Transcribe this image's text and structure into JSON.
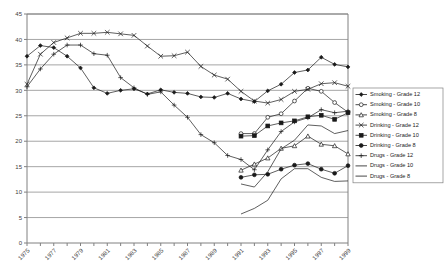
{
  "chart_data": {
    "type": "line",
    "title": "",
    "xlabel": "",
    "ylabel": "",
    "ylim": [
      0,
      45
    ],
    "ytick_step": 5,
    "yticks": [
      0,
      5,
      10,
      15,
      20,
      25,
      30,
      35,
      40,
      45
    ],
    "grid": true,
    "legend_position": "right",
    "x": [
      1975,
      1976,
      1977,
      1978,
      1979,
      1980,
      1981,
      1982,
      1983,
      1984,
      1985,
      1986,
      1987,
      1988,
      1989,
      1990,
      1991,
      1992,
      1993,
      1994,
      1995,
      1996,
      1997,
      1998,
      1999
    ],
    "xtick_labels": [
      "1975",
      "",
      "1977",
      "",
      "1979",
      "",
      "1981",
      "",
      "1983",
      "",
      "1985",
      "",
      "1987",
      "",
      "1989",
      "",
      "1991",
      "",
      "1993",
      "",
      "1995",
      "",
      "1997",
      "",
      "1999"
    ],
    "series": [
      {
        "name": "Smoking - Grade 12",
        "marker": "filled-diamond",
        "x": [
          1975,
          1976,
          1977,
          1978,
          1979,
          1980,
          1981,
          1982,
          1983,
          1984,
          1985,
          1986,
          1987,
          1988,
          1989,
          1990,
          1991,
          1992,
          1993,
          1994,
          1995,
          1996,
          1997,
          1998,
          1999
        ],
        "values": [
          36.7,
          38.8,
          38.4,
          36.7,
          34.4,
          30.5,
          29.4,
          30.0,
          30.3,
          29.3,
          30.1,
          29.6,
          29.4,
          28.7,
          28.6,
          29.4,
          28.3,
          27.8,
          29.9,
          31.2,
          33.5,
          34.0,
          36.5,
          35.1,
          34.6
        ]
      },
      {
        "name": "Smoking - Grade 10",
        "marker": "open-circle",
        "x": [
          1991,
          1992,
          1993,
          1994,
          1995,
          1996,
          1997,
          1998,
          1999
        ],
        "values": [
          21.5,
          21.5,
          24.7,
          25.4,
          27.9,
          30.4,
          29.8,
          27.6,
          25.7
        ]
      },
      {
        "name": "Smoking - Grade 8",
        "marker": "open-triangle",
        "x": [
          1991,
          1992,
          1993,
          1994,
          1995,
          1996,
          1997,
          1998,
          1999
        ],
        "values": [
          14.3,
          15.5,
          16.7,
          18.6,
          19.1,
          21.0,
          19.4,
          19.1,
          17.5
        ]
      },
      {
        "name": "Drinking - Grade 12",
        "marker": "filled-x",
        "x": [
          1975,
          1976,
          1977,
          1978,
          1979,
          1980,
          1981,
          1982,
          1983,
          1984,
          1985,
          1986,
          1987,
          1988,
          1989,
          1990,
          1991,
          1992,
          1993,
          1994,
          1995,
          1996,
          1997,
          1998,
          1999
        ],
        "values": [
          31.2,
          37.1,
          39.4,
          40.3,
          41.2,
          41.2,
          41.4,
          41.1,
          40.8,
          38.7,
          36.7,
          36.8,
          37.5,
          34.7,
          33.0,
          32.2,
          29.8,
          27.9,
          27.5,
          28.2,
          29.8,
          30.2,
          31.3,
          31.5,
          30.8
        ]
      },
      {
        "name": "Drinking - Grade 10",
        "marker": "filled-square",
        "x": [
          1991,
          1992,
          1993,
          1994,
          1995,
          1996,
          1997,
          1998,
          1999
        ],
        "values": [
          21.0,
          21.1,
          23.0,
          23.6,
          24.0,
          24.8,
          25.1,
          24.3,
          25.6
        ]
      },
      {
        "name": "Drinking - Grade 8",
        "marker": "filled-circle",
        "x": [
          1991,
          1992,
          1993,
          1994,
          1995,
          1996,
          1997,
          1998,
          1999
        ],
        "values": [
          12.9,
          13.4,
          13.5,
          14.5,
          15.3,
          15.6,
          14.5,
          13.7,
          15.2
        ]
      },
      {
        "name": "Drugs - Grade 12",
        "marker": "plus",
        "x": [
          1975,
          1976,
          1977,
          1978,
          1979,
          1980,
          1981,
          1982,
          1983,
          1984,
          1985,
          1986,
          1987,
          1988,
          1989,
          1990,
          1991,
          1992,
          1993,
          1994,
          1995,
          1996,
          1997,
          1998,
          1999
        ],
        "values": [
          30.7,
          34.2,
          37.1,
          38.9,
          38.9,
          37.2,
          36.9,
          32.5,
          30.5,
          29.2,
          29.7,
          27.1,
          24.7,
          21.3,
          19.7,
          17.2,
          16.4,
          14.4,
          18.3,
          21.9,
          23.8,
          24.6,
          26.2,
          25.6,
          25.9
        ]
      },
      {
        "name": "Drugs - Grade 10",
        "marker": "line-only",
        "x": [
          1991,
          1992,
          1993,
          1994,
          1995,
          1996,
          1997,
          1998,
          1999
        ],
        "values": [
          11.6,
          11.0,
          14.0,
          18.5,
          20.2,
          23.2,
          23.0,
          21.5,
          22.1
        ]
      },
      {
        "name": "Drugs - Grade 8",
        "marker": "line-only-thick",
        "x": [
          1991,
          1992,
          1993,
          1994,
          1995,
          1996,
          1997,
          1998,
          1999
        ],
        "values": [
          5.7,
          6.8,
          8.4,
          12.6,
          14.6,
          14.6,
          12.9,
          12.1,
          12.2
        ]
      }
    ]
  },
  "legend": {
    "items": [
      {
        "label": "Smoking - Grade 12"
      },
      {
        "label": "Smoking - Grade 10"
      },
      {
        "label": "Smoking - Grade 8"
      },
      {
        "label": "Drinking - Grade 12"
      },
      {
        "label": "Drinking - Grade 10"
      },
      {
        "label": "Drinking - Grade 8"
      },
      {
        "label": "Drugs - Grade 12"
      },
      {
        "label": "Drugs - Grade 10"
      },
      {
        "label": "Drugs - Grade 8"
      }
    ]
  },
  "colors": {
    "line": "#1a1a1a",
    "grid": "#a6a6a6",
    "axis": "#808080",
    "text": "#404040",
    "background": "#ffffff"
  }
}
